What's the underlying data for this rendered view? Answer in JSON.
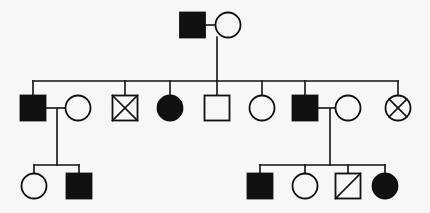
{
  "figure": {
    "kind": "pedigree-chart",
    "background_color": "#f8f7f5",
    "ink_color": "#111111",
    "width": 430,
    "height": 213
  },
  "legend_semantics": {
    "square": "male",
    "circle": "female",
    "filled": "affected",
    "open": "unaffected",
    "x-through": "deceased",
    "diagonal-slash": "deceased"
  },
  "chart_data": {
    "type": "pedigree",
    "title": "",
    "generations": [
      {
        "id": "I",
        "y": 25,
        "individuals": [
          {
            "id": "I-1",
            "sex": "male",
            "shape": "square",
            "fill": "filled",
            "mark": "none",
            "cx": 192.5,
            "cy": 25,
            "size": 25
          },
          {
            "id": "I-2",
            "sex": "female",
            "shape": "circle",
            "fill": "open",
            "mark": "none",
            "cx": 228,
            "cy": 25,
            "size": 25
          }
        ]
      },
      {
        "id": "II",
        "y": 108,
        "individuals": [
          {
            "id": "II-1",
            "sex": "male",
            "shape": "square",
            "fill": "filled",
            "mark": "none",
            "cx": 33,
            "cy": 108,
            "size": 25
          },
          {
            "id": "II-2",
            "sex": "female",
            "shape": "circle",
            "fill": "open",
            "mark": "none",
            "cx": 78,
            "cy": 108,
            "size": 25
          },
          {
            "id": "II-3",
            "sex": "male",
            "shape": "square",
            "fill": "open",
            "mark": "x",
            "cx": 125,
            "cy": 108,
            "size": 25
          },
          {
            "id": "II-4",
            "sex": "female",
            "shape": "circle",
            "fill": "filled",
            "mark": "none",
            "cx": 170,
            "cy": 108,
            "size": 25
          },
          {
            "id": "II-5",
            "sex": "male",
            "shape": "square",
            "fill": "open",
            "mark": "none",
            "cx": 217,
            "cy": 108,
            "size": 25
          },
          {
            "id": "II-6",
            "sex": "female",
            "shape": "circle",
            "fill": "open",
            "mark": "none",
            "cx": 262,
            "cy": 108,
            "size": 25
          },
          {
            "id": "II-7",
            "sex": "male",
            "shape": "square",
            "fill": "filled",
            "mark": "none",
            "cx": 305,
            "cy": 108,
            "size": 25
          },
          {
            "id": "II-8",
            "sex": "female",
            "shape": "circle",
            "fill": "open",
            "mark": "none",
            "cx": 348,
            "cy": 108,
            "size": 25
          },
          {
            "id": "II-9",
            "sex": "female",
            "shape": "circle",
            "fill": "open",
            "mark": "x",
            "cx": 398,
            "cy": 108,
            "size": 25
          }
        ]
      },
      {
        "id": "III",
        "y": 186,
        "individuals": [
          {
            "id": "III-1",
            "sex": "female",
            "shape": "circle",
            "fill": "open",
            "mark": "none",
            "cx": 34,
            "cy": 186,
            "size": 25
          },
          {
            "id": "III-2",
            "sex": "male",
            "shape": "square",
            "fill": "filled",
            "mark": "none",
            "cx": 79,
            "cy": 186,
            "size": 25
          },
          {
            "id": "III-3",
            "sex": "male",
            "shape": "square",
            "fill": "filled",
            "mark": "none",
            "cx": 260,
            "cy": 186,
            "size": 25
          },
          {
            "id": "III-4",
            "sex": "female",
            "shape": "circle",
            "fill": "open",
            "mark": "none",
            "cx": 305,
            "cy": 186,
            "size": 25
          },
          {
            "id": "III-5",
            "sex": "male",
            "shape": "square",
            "fill": "open",
            "mark": "slash",
            "cx": 348,
            "cy": 186,
            "size": 25
          },
          {
            "id": "III-6",
            "sex": "female",
            "shape": "circle",
            "fill": "filled",
            "mark": "none",
            "cx": 385,
            "cy": 186,
            "size": 25
          }
        ]
      }
    ],
    "matings": [
      {
        "id": "M1",
        "partners": [
          "I-1",
          "I-2"
        ],
        "line_y": 25,
        "x1": 205,
        "x2": 216,
        "descent_x": 217
      },
      {
        "id": "M2",
        "partners": [
          "II-1",
          "II-2"
        ],
        "line_y": 108,
        "x1": 46,
        "x2": 66,
        "descent_x": 57
      },
      {
        "id": "M3",
        "partners": [
          "II-7",
          "II-8"
        ],
        "line_y": 108,
        "x1": 318,
        "x2": 336,
        "descent_x": 330
      }
    ],
    "sibships": [
      {
        "id": "S1",
        "from_mating": "M1",
        "sib_line_y": 81,
        "sib_line_x1": 33,
        "sib_line_x2": 398,
        "descent_from_parents_x": 217,
        "descent_from_parents_y1": 37,
        "children_x": [
          33,
          125,
          170,
          217,
          262,
          305,
          398
        ],
        "children_ids": [
          "II-1",
          "II-3",
          "II-4",
          "II-5",
          "II-6",
          "II-7",
          "II-9"
        ]
      },
      {
        "id": "S2",
        "from_mating": "M2",
        "sib_line_y": 165,
        "sib_line_x1": 34,
        "sib_line_x2": 79,
        "descent_from_parents_x": 57,
        "descent_from_parents_y1": 109,
        "children_x": [
          34,
          79
        ],
        "children_ids": [
          "III-1",
          "III-2"
        ]
      },
      {
        "id": "S3",
        "from_mating": "M3",
        "sib_line_y": 165,
        "sib_line_x1": 260,
        "sib_line_x2": 385,
        "descent_from_parents_x": 330,
        "descent_from_parents_y1": 109,
        "children_x": [
          260,
          305,
          348,
          385
        ],
        "children_ids": [
          "III-3",
          "III-4",
          "III-5",
          "III-6"
        ]
      }
    ],
    "counts": {
      "total_individuals": 17,
      "affected": 7,
      "deceased": 3,
      "males": 9,
      "females": 8
    }
  }
}
